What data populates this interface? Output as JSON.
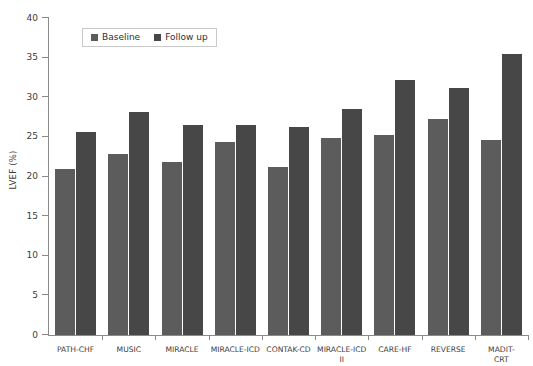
{
  "chart_data": {
    "type": "bar",
    "title": "",
    "subtitle": "",
    "xlabel": "",
    "ylabel": "LVEF (%)",
    "ylim": [
      0,
      40
    ],
    "yticks": [
      0,
      5,
      10,
      15,
      20,
      25,
      30,
      35,
      40
    ],
    "ytick_labels": [
      "0",
      "5",
      "10",
      "15",
      "20",
      "25",
      "30",
      "35",
      "40"
    ],
    "grid": false,
    "legend_position": "upper left",
    "categories": [
      "PATH-CHF",
      "MUSIC",
      "MIRACLE",
      "MIRACLE-ICD",
      "CONTAK-CD",
      "MIRACLE-ICD\nII",
      "CARE-HF",
      "REVERSE",
      "MADIT-CRT"
    ],
    "series": [
      {
        "name": "Baseline",
        "color": "#5c5c5c",
        "values": [
          21.0,
          22.9,
          21.8,
          24.3,
          21.2,
          24.8,
          25.3,
          27.3,
          24.6
        ]
      },
      {
        "name": "Follow up",
        "color": "#474747",
        "values": [
          25.6,
          28.1,
          26.5,
          26.5,
          26.3,
          28.5,
          32.2,
          31.2,
          35.5
        ]
      }
    ]
  },
  "legend": {
    "entries": [
      {
        "label": "Baseline",
        "swatch": "baseline-swatch"
      },
      {
        "label": "Follow up",
        "swatch": "followup-swatch"
      }
    ]
  },
  "axes": {
    "y_title": "LVEF (%)"
  }
}
